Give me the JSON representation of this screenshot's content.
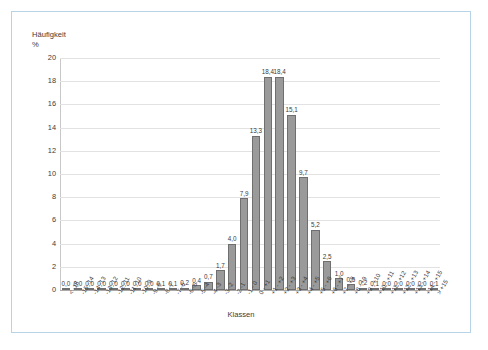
{
  "frame": {
    "border_color": "#b9d3e6"
  },
  "chart_data": {
    "type": "bar",
    "title": "",
    "ylabel": "Häufigkeit\n%",
    "xlabel": "Klassen",
    "ylim": [
      0,
      20
    ],
    "yticks": [
      0,
      2,
      4,
      6,
      8,
      10,
      12,
      14,
      16,
      18,
      20
    ],
    "ytick_labels": [
      "0",
      "2",
      "4",
      "6",
      "8",
      "10",
      "12",
      "14",
      "16",
      "18",
      "20"
    ],
    "grid": true,
    "legend": "none",
    "bar_color": "#9a9a9a",
    "bar_edge_color": "#6f6f6f",
    "categories": [
      "< -15",
      "-15 -14",
      "-14 -13",
      "-13 -12",
      "-12 -11",
      "-11 -10",
      "-10 -9",
      "-9 -8",
      "-8 -7",
      "-7 -6",
      "-6 -5",
      "-5 -4",
      "-4 -3",
      "-3 -2",
      "-2 -1",
      "-1 - 0",
      "0 - +1",
      "+1 - +2",
      "+2 - +3",
      "+3 - +4",
      "+4 - +5",
      "+5 - +6",
      "+6 - +7",
      "+7 - +8",
      "+8 - +9",
      "+9 - +10",
      "+10 - +11",
      "+11 - +12",
      "+12 - +13",
      "+13 - +14",
      "+14 - +15",
      "> +15"
    ],
    "values": [
      0.0,
      0.0,
      0.0,
      0.0,
      0.0,
      0.0,
      0.0,
      0.0,
      0.1,
      0.1,
      0.2,
      0.4,
      0.7,
      1.7,
      4.0,
      7.9,
      13.3,
      18.4,
      18.4,
      15.1,
      9.7,
      5.2,
      2.5,
      1.0,
      0.5,
      0.2,
      0.1,
      0.0,
      0.0,
      0.0,
      0.0,
      0.1
    ],
    "value_labels": [
      "0,0",
      "0,0",
      "0,0",
      "0,0",
      "0,0",
      "0,0",
      "0,0",
      "0,0",
      "0,1",
      "0,1",
      "0,2",
      "0,4",
      "0,7",
      "1,7",
      "4,0",
      "7,9",
      "13,3",
      "18,4",
      "18,4",
      "15,1",
      "9,7",
      "5,2",
      "2,5",
      "1,0",
      "0,5",
      "0,2",
      "0,1",
      "0,0",
      "0,0",
      "0,0",
      "0,0",
      "0,1"
    ]
  }
}
